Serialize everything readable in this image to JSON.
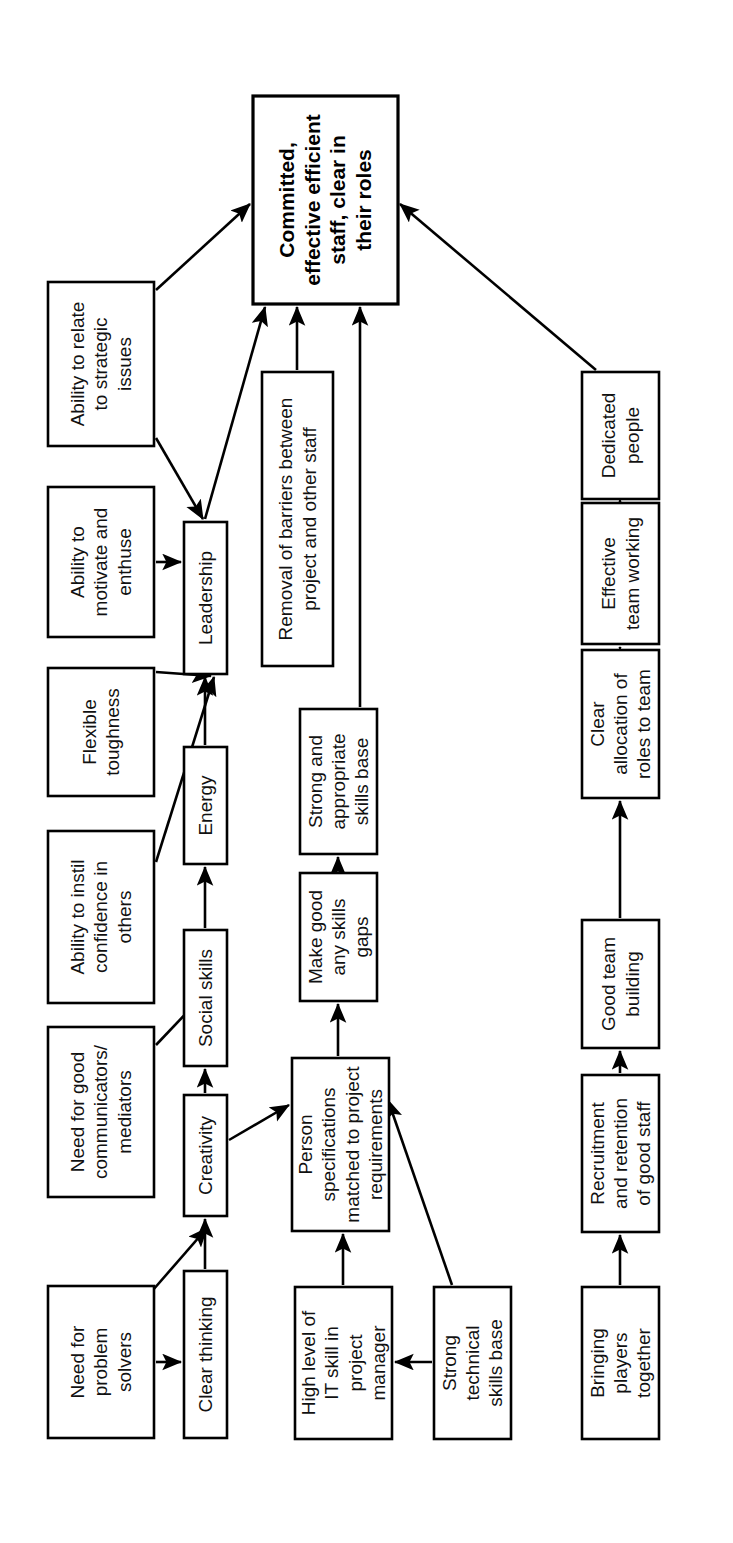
{
  "diagram": {
    "orientation": "rotated-90-ccw",
    "nodes": [
      {
        "id": "goal",
        "label_lines": [
          "Committed,",
          "effective efficient",
          "staff, clear in",
          "their roles"
        ],
        "x": 253,
        "y": 96,
        "w": 145,
        "h": 208,
        "emphasis": "bold"
      },
      {
        "id": "relate",
        "label_lines": [
          "Ability to relate",
          "to strategic",
          "issues"
        ],
        "x": 48,
        "y": 282,
        "w": 106,
        "h": 164
      },
      {
        "id": "motivate",
        "label_lines": [
          "Ability to",
          "motivate and",
          "enthuse"
        ],
        "x": 48,
        "y": 487,
        "w": 106,
        "h": 150
      },
      {
        "id": "flexible",
        "label_lines": [
          "Flexible",
          "toughness"
        ],
        "x": 48,
        "y": 668,
        "w": 106,
        "h": 128
      },
      {
        "id": "instil",
        "label_lines": [
          "Ability to instil",
          "confidence in",
          "others"
        ],
        "x": 48,
        "y": 831,
        "w": 106,
        "h": 172
      },
      {
        "id": "communic",
        "label_lines": [
          "Need for good",
          "communicators/",
          "mediators"
        ],
        "x": 48,
        "y": 1027,
        "w": 106,
        "h": 170
      },
      {
        "id": "problem",
        "label_lines": [
          "Need for",
          "problem",
          "solvers"
        ],
        "x": 48,
        "y": 1286,
        "w": 106,
        "h": 152
      },
      {
        "id": "leadership",
        "label_lines": [
          "Leadership"
        ],
        "x": 184,
        "y": 522,
        "w": 43,
        "h": 152
      },
      {
        "id": "energy",
        "label_lines": [
          "Energy"
        ],
        "x": 184,
        "y": 747,
        "w": 43,
        "h": 117
      },
      {
        "id": "social",
        "label_lines": [
          "Social skills"
        ],
        "x": 184,
        "y": 930,
        "w": 43,
        "h": 136
      },
      {
        "id": "creativity",
        "label_lines": [
          "Creativity"
        ],
        "x": 184,
        "y": 1095,
        "w": 43,
        "h": 121
      },
      {
        "id": "clearthink",
        "label_lines": [
          "Clear thinking"
        ],
        "x": 184,
        "y": 1271,
        "w": 43,
        "h": 167
      },
      {
        "id": "removal",
        "label_lines": [
          "Removal of barriers between",
          "project and other staff"
        ],
        "x": 262,
        "y": 372,
        "w": 71,
        "h": 294
      },
      {
        "id": "strongbase",
        "label_lines": [
          "Strong and",
          "appropriate",
          "skills base"
        ],
        "x": 300,
        "y": 709,
        "w": 77,
        "h": 145
      },
      {
        "id": "makegood",
        "label_lines": [
          "Make good",
          "any skills",
          "gaps"
        ],
        "x": 300,
        "y": 873,
        "w": 77,
        "h": 128
      },
      {
        "id": "personspec",
        "label_lines": [
          "Person",
          "specifications",
          "matched to project",
          "requirements"
        ],
        "x": 292,
        "y": 1058,
        "w": 97,
        "h": 173
      },
      {
        "id": "itskill",
        "label_lines": [
          "High level of",
          "IT skill in",
          "project",
          "manager"
        ],
        "x": 295,
        "y": 1287,
        "w": 97,
        "h": 152
      },
      {
        "id": "techbase",
        "label_lines": [
          "Strong",
          "technical",
          "skills base"
        ],
        "x": 434,
        "y": 1287,
        "w": 77,
        "h": 152
      },
      {
        "id": "dedicated",
        "label_lines": [
          "Dedicated",
          "people"
        ],
        "x": 582,
        "y": 372,
        "w": 77,
        "h": 127
      },
      {
        "id": "teamwork",
        "label_lines": [
          "Effective",
          "team working"
        ],
        "x": 582,
        "y": 503,
        "w": 77,
        "h": 141
      },
      {
        "id": "allocation",
        "label_lines": [
          "Clear",
          "allocation of",
          "roles to team"
        ],
        "x": 582,
        "y": 650,
        "w": 77,
        "h": 148
      },
      {
        "id": "teambuild",
        "label_lines": [
          "Good team",
          "building"
        ],
        "x": 582,
        "y": 920,
        "w": 77,
        "h": 128
      },
      {
        "id": "recruit",
        "label_lines": [
          "Recruitment",
          "and retention",
          "of good staff"
        ],
        "x": 582,
        "y": 1075,
        "w": 77,
        "h": 157
      },
      {
        "id": "bringing",
        "label_lines": [
          "Bringing",
          "players",
          "together"
        ],
        "x": 582,
        "y": 1287,
        "w": 77,
        "h": 152
      }
    ],
    "edges": [
      {
        "from": "relate",
        "to": "goal",
        "path": "M 156,290 L 250,204"
      },
      {
        "from": "relate",
        "to": "leadership",
        "path": "M 156,438 L 203,519"
      },
      {
        "from": "motivate",
        "to": "leadership",
        "path": "M 156,562 L 181,562"
      },
      {
        "from": "flexible",
        "to": "leadership",
        "path": "M 156,672 L 211,676"
      },
      {
        "from": "instil",
        "to": "leadership",
        "path": "M 156,862 L 214,677"
      },
      {
        "from": "communic",
        "to": "social",
        "path": "M 156,1045 L 212,986"
      },
      {
        "from": "leadership",
        "to": "goal",
        "path": "M 205,519 L 265,307"
      },
      {
        "from": "energy",
        "to": "leadership",
        "path": "M 205,745 L 205,677"
      },
      {
        "from": "social",
        "to": "energy",
        "path": "M 205,928 L 205,867"
      },
      {
        "from": "creativity",
        "to": "social",
        "path": "M 205,1093 L 205,1069"
      },
      {
        "from": "clearthink",
        "to": "creativity",
        "path": "M 205,1269 L 205,1219"
      },
      {
        "from": "problem",
        "to": "creativity",
        "path": "M 153,1290 L 207,1228"
      },
      {
        "from": "problem",
        "to": "clearthink",
        "path": "M 156,1362 L 181,1362"
      },
      {
        "from": "removal",
        "to": "goal",
        "path": "M 297,370 L 297,307"
      },
      {
        "from": "strongbase",
        "to": "goal",
        "path": "M 360,707 L 360,307"
      },
      {
        "from": "makegood",
        "to": "strongbase",
        "path": "M 338,871 L 338,857"
      },
      {
        "from": "personspec",
        "to": "makegood",
        "path": "M 338,1056 L 338,1004"
      },
      {
        "from": "creativity",
        "to": "personspec",
        "path": "M 229,1140 L 289,1105"
      },
      {
        "from": "itskill",
        "to": "personspec",
        "path": "M 343,1285 L 343,1234"
      },
      {
        "from": "techbase",
        "to": "personspec",
        "path": "M 452,1285 L 388,1100"
      },
      {
        "from": "techbase",
        "to": "itskill",
        "path": "M 432,1362 L 395,1362"
      },
      {
        "from": "dedicated",
        "to": "goal",
        "path": "M 596,370 L 400,204"
      },
      {
        "from": "teamwork",
        "to": "dedicated",
        "path": "M 620,501 L 620,502"
      },
      {
        "from": "allocation",
        "to": "teamwork",
        "path": "M 620,648 L 620,647"
      },
      {
        "from": "teambuild",
        "to": "allocation",
        "path": "M 620,918 L 620,801"
      },
      {
        "from": "recruit",
        "to": "teambuild",
        "path": "M 620,1073 L 620,1051"
      },
      {
        "from": "bringing",
        "to": "recruit",
        "path": "M 620,1285 L 620,1235"
      }
    ]
  }
}
